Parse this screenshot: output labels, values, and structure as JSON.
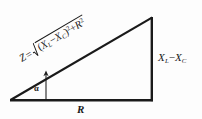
{
  "figure": {
    "background_color": "#fdfdfd",
    "line_color": "#1a1a1a",
    "text_color": "#1a1a1a"
  },
  "labels": {
    "hypotenuse": {
      "name": "impedance-formula",
      "z": "Z",
      "equals": "=",
      "radical_symbol": "√",
      "open_paren": "(",
      "x_l": "X",
      "x_l_sub": "L",
      "minus": "−",
      "x_c": "X",
      "x_c_sub": "C",
      "close_paren": ")",
      "square_1": "2",
      "plus": "+",
      "r": "R",
      "square_2": "2",
      "plain_text": "Z = √((X_L − X_C)² + R²)"
    },
    "vertical_leg": {
      "name": "reactance-label",
      "x_l": "X",
      "x_l_sub": "L",
      "minus": "−",
      "x_c": "X",
      "x_c_sub": "C",
      "plain_text": "X_L − X_C"
    },
    "base": {
      "name": "resistance-label",
      "text": "R"
    },
    "angle": {
      "name": "phase-angle-label",
      "text": "α"
    }
  },
  "geometry": {
    "left_vertex": [
      10,
      100
    ],
    "right_vertex": [
      152,
      100
    ],
    "apex": [
      152,
      17
    ],
    "angle_pointer_base": [
      46,
      100
    ],
    "angle_pointer_tip": [
      46,
      71
    ]
  }
}
